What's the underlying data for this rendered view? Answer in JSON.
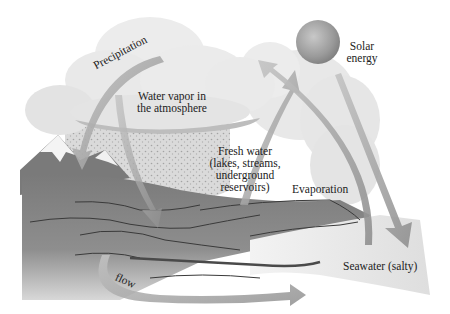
{
  "diagram": {
    "style": "grayscale illustration",
    "colors": {
      "background": "#ffffff",
      "cloud": "#e6e6e6",
      "cloud_shadow": "#bdbdbd",
      "land": "#8a8a8a",
      "land_dark": "#6e6e6e",
      "rivers": "#3a3a3a",
      "arrow": "#a9a9a9",
      "sun": "#a0a0a0",
      "seawater": "#ececec",
      "rain": "#b0b0b0"
    },
    "labels": {
      "precipitation": "Precipitation",
      "water_vapor_line1": "Water vapor in",
      "water_vapor_line2": "the atmosphere",
      "solar_line1": "Solar",
      "solar_line2": "energy",
      "fresh_water_line1": "Fresh water",
      "fresh_water_line2": "(lakes, streams,",
      "fresh_water_line3": "underground",
      "fresh_water_line4": "reservoirs)",
      "evaporation": "Evaporation",
      "seawater": "Seawater (salty)",
      "flow": "flow"
    },
    "nodes": [
      {
        "id": "atmosphere",
        "label": "Water vapor in the atmosphere"
      },
      {
        "id": "sun",
        "label": "Solar energy"
      },
      {
        "id": "fresh_water",
        "label": "Fresh water (lakes, streams, underground reservoirs)"
      },
      {
        "id": "seawater",
        "label": "Seawater (salty)"
      }
    ],
    "edges": [
      {
        "from": "atmosphere",
        "to": "fresh_water",
        "label": "Precipitation"
      },
      {
        "from": "fresh_water",
        "to": "atmosphere",
        "label": "Evaporation"
      },
      {
        "from": "seawater",
        "to": "atmosphere",
        "label": "Evaporation"
      },
      {
        "from": "sun",
        "to": "seawater",
        "label": "Solar energy"
      },
      {
        "from": "fresh_water",
        "to": "seawater",
        "label": "flow"
      }
    ]
  }
}
